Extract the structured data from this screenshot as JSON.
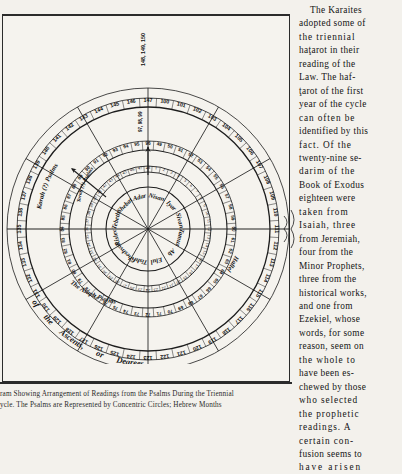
{
  "figure": {
    "caption_lines": [
      "ram Showing Arrangement of Readings from  the  Psalms During the Triennial",
      "ycle.    The   Psalms  are  Represented  by  Concentric  Circles;  Hebrew Months"
    ],
    "arc_labels": {
      "korah": "Korah (?) Psalms",
      "asaph": "The Asaph Psalms",
      "hallel": "Hallel",
      "ascents_1": "of",
      "ascents_2": "the",
      "ascents_3": "Ascents,",
      "ascents_4": "or",
      "ascents_5": "Degrees",
      "inner_ring": "Torah (?) Psalms"
    },
    "months": [
      "Nisan",
      "Iyar",
      "Sivan",
      "Tamuz",
      "Ab",
      "Elul",
      "Tishri",
      "Cheshvan",
      "Kislev",
      "Tebeth",
      "Shebat",
      "Adar"
    ],
    "ring_outer_top_stack": "148, 149, 150",
    "ring_second_top_stack": "97, 98, 99",
    "ring_outer_numbers": [
      "100",
      "101",
      "102",
      "103",
      "104",
      "105",
      "106",
      "107",
      "108",
      "109",
      "110",
      "111",
      "112",
      "113",
      "114",
      "115",
      "116",
      "117",
      "118",
      "119",
      "120",
      "121",
      "122",
      "123",
      "124",
      "125",
      "126",
      "127",
      "128",
      "129",
      "130",
      "131",
      "132",
      "133",
      "134",
      "135",
      "136",
      "137",
      "138",
      "139",
      "140",
      "141",
      "142",
      "143",
      "144",
      "145",
      "146",
      "147"
    ],
    "ring_second_numbers": [
      "49",
      "50",
      "51",
      "52",
      "53",
      "54",
      "55",
      "56",
      "57",
      "58",
      "59",
      "60",
      "61",
      "62",
      "63",
      "64",
      "65",
      "66",
      "67",
      "68",
      "69",
      "70",
      "71",
      "72",
      "73",
      "74",
      "75",
      "76",
      "77",
      "78",
      "79",
      "80",
      "81",
      "82",
      "83",
      "84",
      "85",
      "86",
      "87",
      "88",
      "89",
      "90",
      "91",
      "92",
      "93",
      "94",
      "95",
      "96"
    ],
    "ring_inner_numbers": [
      "1",
      "2",
      "3",
      "4",
      "5",
      "6",
      "7",
      "8",
      "9",
      "10",
      "11",
      "12",
      "13",
      "14",
      "15",
      "16",
      "17",
      "18",
      "19",
      "20",
      "21",
      "22",
      "23",
      "24",
      "25",
      "26",
      "27",
      "28",
      "29",
      "30",
      "31",
      "32",
      "33",
      "34",
      "35",
      "36",
      "37",
      "38",
      "39",
      "40",
      "41",
      "42",
      "43",
      "44",
      "45",
      "46",
      "47",
      "48"
    ]
  },
  "article": {
    "lines": [
      {
        "text": "The   Karaites",
        "cls": "ind sp3"
      },
      {
        "text": "adopted some of",
        "cls": "sp3"
      },
      {
        "text": "the  triennial",
        "cls": "sp1"
      },
      {
        "text": "haţarot in their",
        "cls": "sp3"
      },
      {
        "text": "reading  of  the",
        "cls": "sp3"
      },
      {
        "text": "Law.  The haf-",
        "cls": "sp3"
      },
      {
        "text": "ţarot of the first",
        "cls": "sp3"
      },
      {
        "text": "year of the cycle",
        "cls": "sp3"
      },
      {
        "text": "can often be",
        "cls": "sp1"
      },
      {
        "text": "identified by this",
        "cls": "sp3"
      },
      {
        "text": "fact.  Of the",
        "cls": "sp1"
      },
      {
        "text": "twenty-nine se-",
        "cls": "sp3"
      },
      {
        "text": "darim of the",
        "cls": "sp1"
      },
      {
        "text": "Book of Exodus",
        "cls": "sp3"
      },
      {
        "text": "eighteen  were",
        "cls": "sp3"
      },
      {
        "text": "taken  from",
        "cls": "sp1"
      },
      {
        "text": "Isaiah, three",
        "cls": "sp1"
      },
      {
        "text": "from  Jeremiah,",
        "cls": "sp3"
      },
      {
        "text": "four   from   the",
        "cls": "sp3"
      },
      {
        "text": "Minor Prophets,",
        "cls": "sp3"
      },
      {
        "text": "three  from  the",
        "cls": "sp3"
      },
      {
        "text": "historical works,",
        "cls": "sp3"
      },
      {
        "text": "and   one   from",
        "cls": "sp3"
      },
      {
        "text": "Ezekiel,  whose",
        "cls": "sp3"
      },
      {
        "text": "words, for some",
        "cls": "sp3"
      },
      {
        "text": "reason, seem on",
        "cls": "sp3"
      },
      {
        "text": "the  whole  to",
        "cls": "sp1"
      },
      {
        "text": "have  been  es-",
        "cls": "sp3"
      },
      {
        "text": "chewed by those",
        "cls": "sp3"
      },
      {
        "text": "who selected",
        "cls": "sp1"
      },
      {
        "text": "the  prophetic",
        "cls": "sp1"
      },
      {
        "text": "readings.   A",
        "cls": "sp1"
      },
      {
        "text": "certain  con-",
        "cls": "sp1"
      },
      {
        "text": "fusion seems to",
        "cls": "sp3"
      },
      {
        "text": "have arisen",
        "cls": "sp2"
      }
    ]
  }
}
